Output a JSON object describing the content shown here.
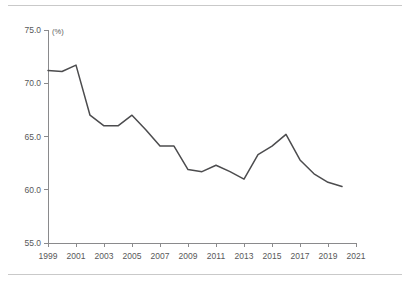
{
  "chart_data": {
    "type": "line",
    "title": "",
    "subtitle": "",
    "xlabel": "",
    "ylabel": "",
    "unit_label": "(%)",
    "x": [
      1999,
      2000,
      2001,
      2002,
      2003,
      2004,
      2005,
      2006,
      2007,
      2008,
      2009,
      2010,
      2011,
      2012,
      2013,
      2014,
      2015,
      2016,
      2017,
      2018,
      2019,
      2020
    ],
    "values": [
      71.2,
      71.1,
      71.7,
      67.0,
      66.0,
      66.0,
      67.0,
      65.6,
      64.1,
      64.1,
      61.9,
      61.7,
      62.3,
      61.7,
      61.0,
      63.3,
      64.1,
      65.2,
      62.8,
      61.5,
      60.7,
      60.3
    ],
    "series": [
      {
        "name": "",
        "values": [
          71.2,
          71.1,
          71.7,
          67.0,
          66.0,
          66.0,
          67.0,
          65.6,
          64.1,
          64.1,
          61.9,
          61.7,
          62.3,
          61.7,
          61.0,
          63.3,
          64.1,
          65.2,
          62.8,
          61.5,
          60.7,
          60.3
        ],
        "color": "#4c4c4e"
      }
    ],
    "xlim": [
      1999,
      2021
    ],
    "ylim": [
      55.0,
      75.0
    ],
    "ytick_labels": [
      "75.0",
      "70.0",
      "65.0",
      "60.0",
      "55.0"
    ],
    "ytick_values": [
      75.0,
      70.0,
      65.0,
      60.0,
      55.0
    ],
    "xtick_labels": [
      "1999",
      "2001",
      "2003",
      "2005",
      "2007",
      "2009",
      "2011",
      "2013",
      "2015",
      "2017",
      "2019",
      "2021"
    ],
    "xtick_values": [
      1999,
      2001,
      2003,
      2005,
      2007,
      2009,
      2011,
      2013,
      2015,
      2017,
      2019,
      2021
    ],
    "grid": false,
    "legend": false,
    "legend_position": "none",
    "line_color": "#4c4c4e",
    "axis_color": "#8a8a8c",
    "text_color": "#58585a",
    "background": "#ffffff"
  }
}
